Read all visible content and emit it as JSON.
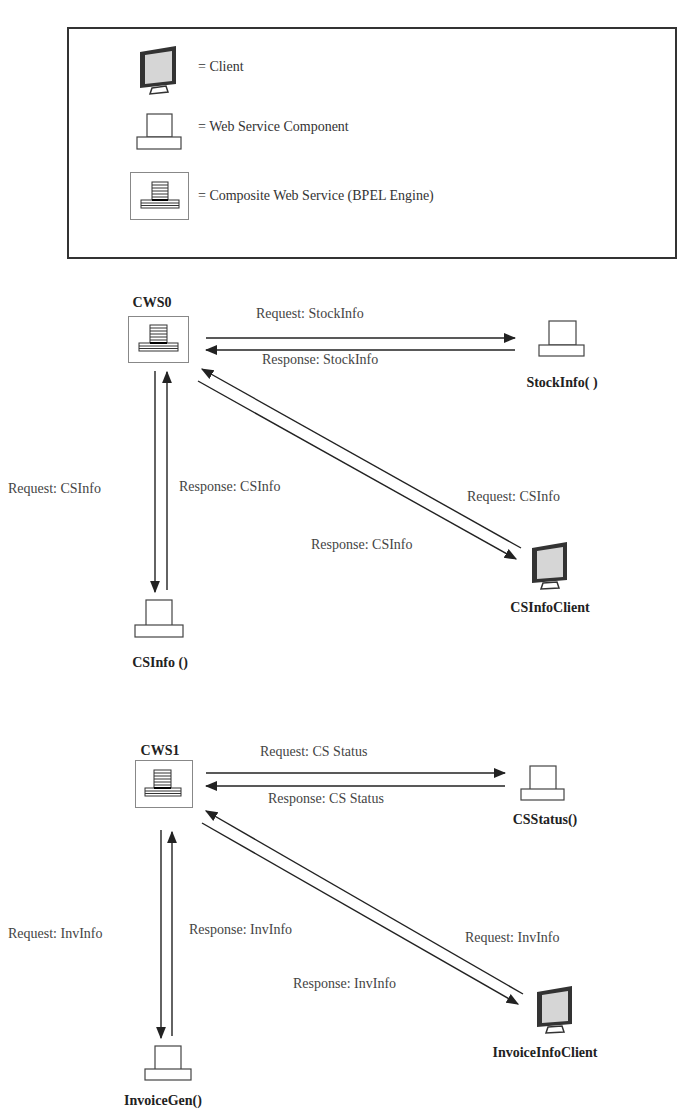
{
  "legend": {
    "items": [
      {
        "icon": "client-monitor-icon",
        "label": "= Client"
      },
      {
        "icon": "web-service-component-icon",
        "label": "= Web Service Component"
      },
      {
        "icon": "composite-web-service-icon",
        "label": "= Composite Web Service (BPEL Engine)"
      }
    ]
  },
  "diagrams": [
    {
      "composite": "CWS0",
      "service_right": "StockInfo( )",
      "service_bottom": "CSInfo ()",
      "client": "CSInfoClient",
      "messages": {
        "request_right": "Request: StockInfo",
        "response_right": "Response: StockInfo",
        "request_bottom": "Request: CSInfo",
        "response_bottom": "Response: CSInfo",
        "request_client": "Request: CSInfo",
        "response_client": "Response: CSInfo"
      }
    },
    {
      "composite": "CWS1",
      "service_right": "CSStatus()",
      "service_bottom": "InvoiceGen()",
      "client": "InvoiceInfoClient",
      "messages": {
        "request_right": "Request: CS Status",
        "response_right": "Response: CS Status",
        "request_bottom": "Request: InvInfo",
        "response_bottom": "Response: InvInfo",
        "request_client": "Request: InvInfo",
        "response_client": "Response: InvInfo"
      }
    }
  ],
  "colors": {
    "line": "#222222",
    "screen": "#d8d8d8",
    "text": "#444444"
  }
}
